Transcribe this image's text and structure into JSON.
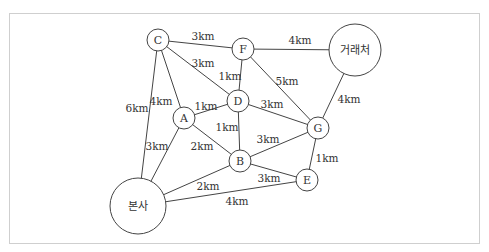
{
  "diagram": {
    "type": "weighted-graph",
    "nodes": [
      {
        "id": "C",
        "label": "C",
        "x": 158,
        "y": 40,
        "r": 11
      },
      {
        "id": "F",
        "label": "F",
        "x": 243,
        "y": 49,
        "r": 11
      },
      {
        "id": "client",
        "label": "거래처",
        "x": 355,
        "y": 50,
        "r": 26
      },
      {
        "id": "D",
        "label": "D",
        "x": 238,
        "y": 101,
        "r": 11
      },
      {
        "id": "A",
        "label": "A",
        "x": 184,
        "y": 118,
        "r": 11
      },
      {
        "id": "G",
        "label": "G",
        "x": 318,
        "y": 128,
        "r": 11
      },
      {
        "id": "B",
        "label": "B",
        "x": 240,
        "y": 161,
        "r": 11
      },
      {
        "id": "E",
        "label": "E",
        "x": 307,
        "y": 180,
        "r": 11
      },
      {
        "id": "hq",
        "label": "본사",
        "x": 138,
        "y": 206,
        "r": 28
      }
    ],
    "edges": [
      {
        "from": "C",
        "to": "F",
        "label": "3km",
        "lx": 203,
        "ly": 36
      },
      {
        "from": "C",
        "to": "D",
        "label": "3km",
        "lx": 203,
        "ly": 63
      },
      {
        "from": "C",
        "to": "A",
        "label": "4km",
        "lx": 161,
        "ly": 101
      },
      {
        "from": "C",
        "to": "hq",
        "label": "6km",
        "lx": 137,
        "ly": 108
      },
      {
        "from": "F",
        "to": "client",
        "label": "4km",
        "lx": 300,
        "ly": 40
      },
      {
        "from": "F",
        "to": "D",
        "label": "1km",
        "lx": 230,
        "ly": 76
      },
      {
        "from": "F",
        "to": "G",
        "label": "5km",
        "lx": 287,
        "ly": 81
      },
      {
        "from": "client",
        "to": "G",
        "label": "4km",
        "lx": 349,
        "ly": 99
      },
      {
        "from": "A",
        "to": "D",
        "label": "1km",
        "lx": 206,
        "ly": 106
      },
      {
        "from": "D",
        "to": "G",
        "label": "3km",
        "lx": 272,
        "ly": 104
      },
      {
        "from": "D",
        "to": "B",
        "label": "1km",
        "lx": 227,
        "ly": 127
      },
      {
        "from": "A",
        "to": "B",
        "label": "2km",
        "lx": 202,
        "ly": 146
      },
      {
        "from": "A",
        "to": "hq",
        "label": "3km",
        "lx": 157,
        "ly": 146
      },
      {
        "from": "B",
        "to": "G",
        "label": "3km",
        "lx": 268,
        "ly": 139
      },
      {
        "from": "G",
        "to": "E",
        "label": "1km",
        "lx": 327,
        "ly": 158
      },
      {
        "from": "B",
        "to": "E",
        "label": "3km",
        "lx": 269,
        "ly": 178
      },
      {
        "from": "B",
        "to": "hq",
        "label": "2km",
        "lx": 208,
        "ly": 186
      },
      {
        "from": "hq",
        "to": "E",
        "label": "4km",
        "lx": 237,
        "ly": 201
      }
    ]
  }
}
